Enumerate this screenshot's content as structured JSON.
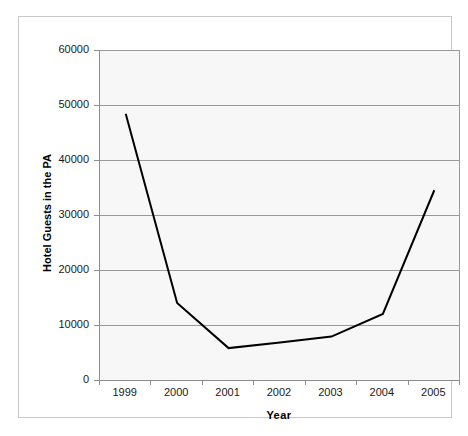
{
  "chart_data": {
    "type": "line",
    "title": "",
    "xlabel": "Year",
    "ylabel": "Hotel Guests in the PA",
    "categories": [
      "1999",
      "2000",
      "2001",
      "2002",
      "2003",
      "2004",
      "2005"
    ],
    "values": [
      48400,
      14000,
      5800,
      6800,
      7900,
      12000,
      34500
    ],
    "series": [
      {
        "name": "Hotel Guests in the PA",
        "values": [
          48400,
          14000,
          5800,
          6800,
          7900,
          12000,
          34500
        ]
      }
    ],
    "ylim": [
      0,
      60000
    ],
    "ytick_labels": [
      "0",
      "10000",
      "20000",
      "30000",
      "40000",
      "50000",
      "60000"
    ],
    "ytick_values": [
      0,
      10000,
      20000,
      30000,
      40000,
      50000,
      60000
    ],
    "xtick_labels": [
      "1999",
      "2000",
      "2001",
      "2002",
      "2003",
      "2004",
      "2005"
    ],
    "grid": "horizontal",
    "legend": "none",
    "colors": {
      "line": "#000000",
      "plot_background": "#f7f7f7",
      "gridline": "#9a9a9a",
      "axis": "#8d8d8d",
      "frame": "#c9c9c9",
      "text": "#1a1a1a"
    }
  }
}
